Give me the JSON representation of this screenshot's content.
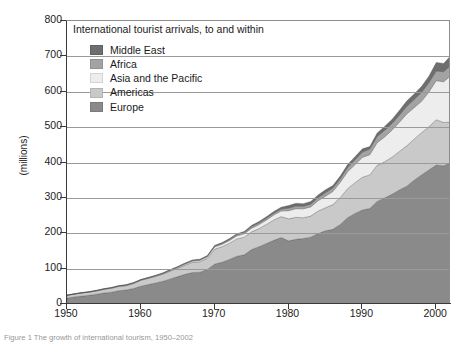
{
  "chart_title": "International tourist arrivals, to and within",
  "caption": "Figure 1  The growth of international tourism, 1950–2002",
  "axes": {
    "ylabel": "(millions)",
    "yticks": [
      0,
      100,
      200,
      300,
      400,
      500,
      600,
      700,
      800
    ],
    "xticks": [
      1950,
      1960,
      1970,
      1980,
      1990,
      2000
    ],
    "ylim": [
      0,
      800
    ],
    "xlim": [
      1950,
      2002
    ],
    "grid": "horizontal"
  },
  "legend": {
    "position": "inside-top-left",
    "items": [
      {
        "label": "Middle East",
        "color": "#6e6e6e"
      },
      {
        "label": "Africa",
        "color": "#a3a3a3"
      },
      {
        "label": "Asia and the Pacific",
        "color": "#ededed"
      },
      {
        "label": "Americas",
        "color": "#c9c9c9"
      },
      {
        "label": "Europe",
        "color": "#8a8a8a"
      }
    ]
  },
  "chart_data": {
    "type": "area",
    "stacked": true,
    "title": "International tourist arrivals, to and within",
    "xlabel": "",
    "ylabel": "(millions)",
    "ylim": [
      0,
      800
    ],
    "xlim": [
      1950,
      2002
    ],
    "grid": true,
    "legend_position": "inside-top-left",
    "x": [
      1950,
      1951,
      1952,
      1953,
      1954,
      1955,
      1956,
      1957,
      1958,
      1959,
      1960,
      1961,
      1962,
      1963,
      1964,
      1965,
      1966,
      1967,
      1968,
      1969,
      1970,
      1971,
      1972,
      1973,
      1974,
      1975,
      1976,
      1977,
      1978,
      1979,
      1980,
      1981,
      1982,
      1983,
      1984,
      1985,
      1986,
      1987,
      1988,
      1989,
      1990,
      1991,
      1992,
      1993,
      1994,
      1995,
      1996,
      1997,
      1998,
      1999,
      2000,
      2001,
      2002
    ],
    "stack_order_bottom_to_top": [
      "Europe",
      "Americas",
      "Asia and the Pacific",
      "Africa",
      "Middle East"
    ],
    "series": [
      {
        "name": "Europe",
        "color": "#8a8a8a",
        "values": [
          16.8,
          20.0,
          22.5,
          24.5,
          27.5,
          31.0,
          33.5,
          37.5,
          39.5,
          44.0,
          50.4,
          55.0,
          59.5,
          64.5,
          71.0,
          77.5,
          84.0,
          89.0,
          90.0,
          97.5,
          113.0,
          118.0,
          126.0,
          135.0,
          139.0,
          153.9,
          162.0,
          171.0,
          180.0,
          188.0,
          178.5,
          183.0,
          185.0,
          189.0,
          199.0,
          207.0,
          211.0,
          225.0,
          244.0,
          256.0,
          265.6,
          270.0,
          290.0,
          300.0,
          310.0,
          322.3,
          333.0,
          350.0,
          365.0,
          379.0,
          392.7,
          390.8,
          399.8
        ]
      },
      {
        "name": "Americas",
        "color": "#c9c9c9",
        "values": [
          7.5,
          8.0,
          8.5,
          9.0,
          9.5,
          10.5,
          11.0,
          12.0,
          12.5,
          13.5,
          16.7,
          17.5,
          18.5,
          20.0,
          22.0,
          23.5,
          26.0,
          29.0,
          29.5,
          31.5,
          42.3,
          44.0,
          46.0,
          49.0,
          50.0,
          50.0,
          51.5,
          54.0,
          57.5,
          59.0,
          62.3,
          62.0,
          59.0,
          59.5,
          64.0,
          65.0,
          70.0,
          76.0,
          82.0,
          87.0,
          92.8,
          95.0,
          102.0,
          102.0,
          105.0,
          109.0,
          114.0,
          116.0,
          119.0,
          122.0,
          128.2,
          122.4,
          114.9
        ]
      },
      {
        "name": "Asia and the Pacific",
        "color": "#ededed",
        "values": [
          0.2,
          0.3,
          0.4,
          0.5,
          0.6,
          0.7,
          0.8,
          1.0,
          1.1,
          1.3,
          0.9,
          1.1,
          1.3,
          1.6,
          2.0,
          2.5,
          3.0,
          3.4,
          3.8,
          4.3,
          6.2,
          6.8,
          7.6,
          8.8,
          9.6,
          10.2,
          11.0,
          12.4,
          14.0,
          16.0,
          23.0,
          24.5,
          25.0,
          26.0,
          29.0,
          32.9,
          37.0,
          43.0,
          48.0,
          51.0,
          56.2,
          57.0,
          64.0,
          70.0,
          76.0,
          82.4,
          90.0,
          89.0,
          89.0,
          98.0,
          110.5,
          115.2,
          131.3
        ]
      },
      {
        "name": "Africa",
        "color": "#a3a3a3",
        "values": [
          0.5,
          0.5,
          0.6,
          0.6,
          0.7,
          0.8,
          0.9,
          1.0,
          1.1,
          1.2,
          0.8,
          0.9,
          1.0,
          1.2,
          1.4,
          1.5,
          1.7,
          1.8,
          2.0,
          2.2,
          2.4,
          2.7,
          3.0,
          3.4,
          3.6,
          4.7,
          4.9,
          5.1,
          5.3,
          5.8,
          7.2,
          7.8,
          7.5,
          7.7,
          8.4,
          9.7,
          9.9,
          10.0,
          12.0,
          13.5,
          15.0,
          16.0,
          17.5,
          18.5,
          18.8,
          20.0,
          21.5,
          23.0,
          25.0,
          26.5,
          27.4,
          28.3,
          29.1
        ]
      },
      {
        "name": "Middle East",
        "color": "#6e6e6e",
        "values": [
          0.2,
          0.2,
          0.2,
          0.3,
          0.3,
          0.3,
          0.4,
          0.4,
          0.5,
          0.5,
          0.6,
          0.7,
          0.8,
          0.9,
          1.0,
          1.2,
          1.3,
          1.4,
          1.5,
          1.7,
          1.9,
          2.1,
          2.3,
          2.6,
          2.9,
          3.5,
          3.8,
          4.2,
          4.6,
          5.0,
          7.1,
          7.5,
          7.2,
          7.5,
          8.0,
          8.5,
          7.0,
          7.5,
          8.5,
          9.0,
          9.0,
          7.0,
          10.0,
          11.0,
          12.0,
          13.5,
          15.0,
          15.5,
          16.5,
          18.0,
          24.2,
          23.3,
          27.6
        ]
      }
    ],
    "totals_note": "Stacked totals rise from ~25 million in 1950 to ~700 million in 2002"
  }
}
